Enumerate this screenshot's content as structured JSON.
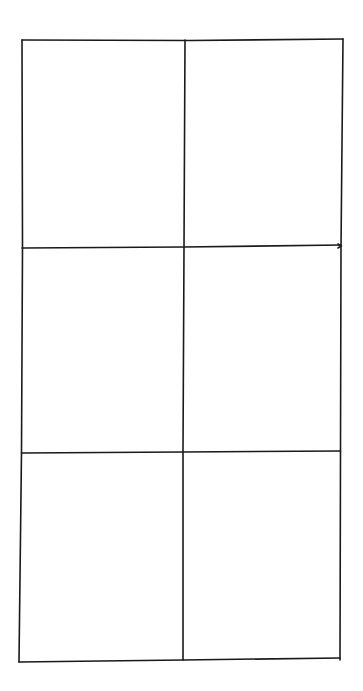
{
  "diagram": {
    "type": "hand-drawn grid sketch",
    "rows": 3,
    "columns": 2,
    "line_color": "#1a1a1a",
    "background": "#ffffff",
    "cells": [
      {
        "row": 1,
        "col": 1,
        "label": ""
      },
      {
        "row": 1,
        "col": 2,
        "label": ""
      },
      {
        "row": 2,
        "col": 1,
        "label": ""
      },
      {
        "row": 2,
        "col": 2,
        "label": ""
      },
      {
        "row": 3,
        "col": 1,
        "label": ""
      },
      {
        "row": 3,
        "col": 2,
        "label": ""
      }
    ]
  }
}
